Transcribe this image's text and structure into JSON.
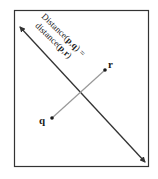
{
  "diagram": {
    "type": "perpendicular-bisector",
    "bisector_label": {
      "line1": {
        "prefix": "Distance(",
        "p": "p",
        "comma": ",",
        "q": "q",
        "suffix": ") ="
      },
      "line2": {
        "prefix": "distance(",
        "p": "p",
        "comma": ",",
        "r": "r",
        "suffix": ")"
      }
    },
    "points": [
      {
        "id": "q",
        "label": "q"
      },
      {
        "id": "r",
        "label": "r"
      }
    ],
    "colors": {
      "frame": "#333333",
      "bisector": "#333333",
      "segment": "#999999",
      "point": "#1a1a1a"
    }
  }
}
